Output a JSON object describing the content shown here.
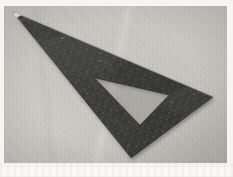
{
  "image": {
    "subject": "set-square drafting triangle",
    "caption": "Dark speckled stone set-square (right-triangle ruler) with a triangular cut-out, lying on a light gray textured surface",
    "orientation": "landscape",
    "width": 233,
    "height": 177
  },
  "frame": {
    "border_color": "#f6f5f2",
    "bottom_band_color": "#faf9f7",
    "photo_left": 4,
    "photo_top": 6,
    "photo_width": 223,
    "photo_height": 157
  },
  "background": {
    "name": "work-surface",
    "description": "light warm-gray textured board",
    "color_light": "#cbc9c5",
    "color_mid": "#c3c1bc",
    "color_dark": "#b8b6b1"
  },
  "object": {
    "name": "triangle-ruler",
    "material": "speckled granite-like dark stone",
    "color_body": "#3c3c3a",
    "color_body_dark": "#2c2c2b",
    "color_body_light": "#565654",
    "color_edge_highlight": "#6e6e6a",
    "tip_highlight_color": "#e8e6e1",
    "outer_vertices": [
      {
        "label": "apex-left",
        "x": 9,
        "y": 6
      },
      {
        "label": "vertex-right",
        "x": 209,
        "y": 91
      },
      {
        "label": "vertex-bottom",
        "x": 127,
        "y": 152
      }
    ],
    "inner_cutout_vertices": [
      {
        "label": "cut-left",
        "x": 91,
        "y": 72
      },
      {
        "label": "cut-right",
        "x": 165,
        "y": 89
      },
      {
        "label": "cut-bottom",
        "x": 136,
        "y": 119
      }
    ],
    "shadow_color": "rgba(70,68,64,0.30)"
  },
  "speckles": {
    "description": "granite speckle flecks on the ruler body",
    "light_fleck_color": "#8d8d88",
    "dark_fleck_color": "#1e1e1d"
  }
}
